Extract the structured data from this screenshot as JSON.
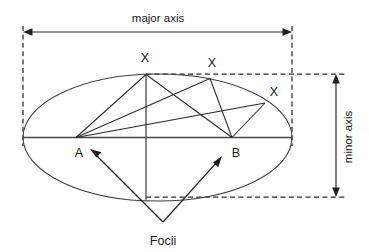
{
  "figure": {
    "background_color": "#ffffff",
    "line_color": "#2a2a2a",
    "text_color": "#1a1a1a",
    "width": 369,
    "height": 252
  },
  "labels": {
    "major_axis": "major axis",
    "minor_axis": "minor axis",
    "focus_a": "A",
    "focus_b": "B",
    "point_x_1": "X",
    "point_x_2": "X",
    "point_x_3": "X",
    "focii": "Focii"
  },
  "geometry": {
    "ellipse": {
      "center_x": 157.5,
      "center_y": 137.5,
      "radius_x": 134.5,
      "radius_y": 63.5
    },
    "focus_a": {
      "x": 76,
      "y": 137.5
    },
    "focus_b": {
      "x": 232,
      "y": 137.5
    },
    "points_on_ellipse": [
      {
        "name": "X1",
        "x": 146,
        "y": 74.5
      },
      {
        "name": "X2",
        "x": 210,
        "y": 78.5
      },
      {
        "name": "X3",
        "x": 265,
        "y": 103
      }
    ],
    "major_axis_dimension": {
      "y": 32,
      "x_start": 23,
      "x_end": 292
    },
    "minor_axis_dimension": {
      "x": 336,
      "y_top": 74,
      "y_bottom": 197
    },
    "focii_callout_vertex": {
      "x": 163,
      "y": 222
    }
  },
  "annotations": {
    "major_axis_label_position": {
      "x": 158,
      "y": 18
    },
    "minor_axis_label_position": {
      "x": 352,
      "y": 137
    },
    "focii_label_position": {
      "x": 163,
      "y": 243
    }
  }
}
